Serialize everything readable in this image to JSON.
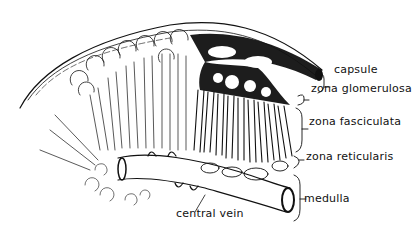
{
  "figure": {
    "colors": {
      "ink": "#111111",
      "background": "#ffffff"
    },
    "labels": {
      "capsule": "capsule",
      "zona_glomerulosa": "zona glomerulosa",
      "zona_fasciculata": "zona fasciculata",
      "zona_reticularis": "zona reticularis",
      "medulla": "medulla",
      "central_vein": "central vein"
    }
  }
}
